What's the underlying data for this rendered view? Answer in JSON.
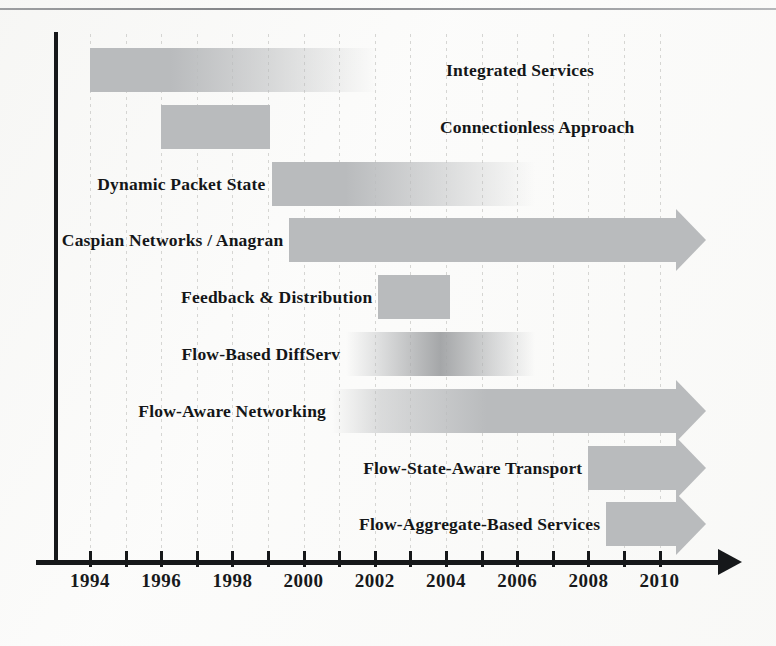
{
  "figure": {
    "kind": "timeline-gantt",
    "paper_background": "#fbfbfa",
    "ink_color": "#16181a",
    "bar_color": "#b9bbbd"
  },
  "chart_data": {
    "type": "bar",
    "orientation": "horizontal",
    "title": "",
    "xlabel": "",
    "ylabel": "",
    "xlim": [
      1993,
      2011.3
    ],
    "grid": true,
    "legend": "none",
    "tick_labels": [
      "1994",
      "1996",
      "1998",
      "2000",
      "2002",
      "2004",
      "2006",
      "2008",
      "2010"
    ],
    "tick_values": [
      1994,
      1996,
      1998,
      2000,
      2002,
      2004,
      2006,
      2008,
      2010
    ],
    "minor_tick_values": [
      1995,
      1997,
      1999,
      2001,
      2003,
      2005,
      2007,
      2009
    ],
    "categories": [
      "Integrated Services",
      "Connectionless Approach",
      "Dynamic Packet State",
      "Caspian Networks / Anagran",
      "Feedback & Distribution",
      "Flow-Based DiffServ",
      "Flow-Aware Networking",
      "Flow-State-Aware Transport",
      "Flow-Aggregate-Based Services"
    ],
    "bars": [
      {
        "label": "Integrated Services",
        "start": 1994.0,
        "end": 2002.1,
        "label_side": "right",
        "label_x": 1997.3,
        "arrow": false,
        "fade": "tail",
        "row": 0
      },
      {
        "label": "Connectionless Approach",
        "start": 1996.0,
        "end": 1999.05,
        "label_side": "right",
        "label_x": 1997.8,
        "arrow": false,
        "fade": "none",
        "row": 1
      },
      {
        "label": "Dynamic Packet State",
        "start": 1999.1,
        "end": 2006.5,
        "label_side": "left",
        "arrow": false,
        "fade": "tail",
        "row": 2
      },
      {
        "label": "Caspian Networks / Anagran",
        "start": 1999.6,
        "end": 2011.2,
        "label_side": "left",
        "arrow": true,
        "fade": "none",
        "row": 3
      },
      {
        "label": "Feedback & Distribution",
        "start": 2002.1,
        "end": 2004.1,
        "label_side": "left",
        "arrow": false,
        "fade": "none",
        "row": 4
      },
      {
        "label": "Flow-Based DiffServ",
        "start": 2001.2,
        "end": 2006.5,
        "label_side": "left",
        "arrow": false,
        "fade": "both",
        "row": 5
      },
      {
        "label": "Flow-Aware Networking",
        "start": 2000.8,
        "end": 2011.2,
        "label_side": "left",
        "arrow": true,
        "fade": "head",
        "row": 6
      },
      {
        "label": "Flow-State-Aware Transport",
        "start": 2008.0,
        "end": 2011.2,
        "label_side": "left",
        "arrow": true,
        "fade": "none",
        "row": 7
      },
      {
        "label": "Flow-Aggregate-Based Services",
        "start": 2008.5,
        "end": 2011.2,
        "label_side": "left",
        "arrow": true,
        "fade": "none",
        "row": 8
      }
    ]
  },
  "axis": {
    "arrow_icon": "arrow-right-icon"
  }
}
